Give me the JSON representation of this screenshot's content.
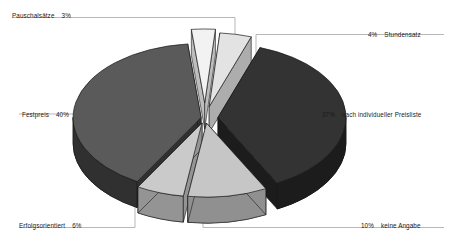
{
  "chart_data": {
    "type": "pie",
    "title": "",
    "subtitle": "",
    "xlabel": "",
    "ylabel": "",
    "legend_position": "outside-labels",
    "grid": false,
    "exploded": true,
    "three_d": true,
    "unit": "%",
    "total": 100,
    "categories": [
      "Pauschalsätze",
      "Stundensatz",
      "nach individueller Preisliste",
      "keine Angabe",
      "Erfolgsorientiert",
      "Festpreis"
    ],
    "values": [
      3,
      4,
      37,
      10,
      6,
      40
    ],
    "slices": [
      {
        "label": "Pauschalsätze",
        "value": 3,
        "value_text": "3%",
        "color": "#f2f2f2",
        "side_color": "#bdbdbd",
        "label_side": "left",
        "label_x": 12,
        "label_y": 11
      },
      {
        "label": "Stundensatz",
        "value": 4,
        "value_text": "4%",
        "color": "#e3e3e3",
        "side_color": "#adadad",
        "label_side": "right",
        "label_x": 368,
        "label_y": 30
      },
      {
        "label": "nach individueller Preisliste",
        "value": 37,
        "value_text": "37%",
        "color": "#333333",
        "side_color": "#1c1c1c",
        "label_side": "right",
        "label_x": 322,
        "label_y": 110
      },
      {
        "label": "keine Angabe",
        "value": 10,
        "value_text": "10%",
        "color": "#c6c6c6",
        "side_color": "#909090",
        "label_side": "right",
        "label_x": 361,
        "label_y": 221
      },
      {
        "label": "Erfolgsorientiert",
        "value": 6,
        "value_text": "6%",
        "color": "#cacaca",
        "side_color": "#949494",
        "label_side": "left",
        "label_x": 19,
        "label_y": 221
      },
      {
        "label": "Festpreis",
        "value": 40,
        "value_text": "40%",
        "color": "#5a5a5a",
        "side_color": "#303030",
        "label_side": "left",
        "label_x": 22,
        "label_y": 110
      }
    ],
    "colors": {
      "background": "#ffffff",
      "leader_line": "#9a9a9a",
      "outline": "#1a1a1a",
      "text": "#1a1a1a"
    }
  }
}
